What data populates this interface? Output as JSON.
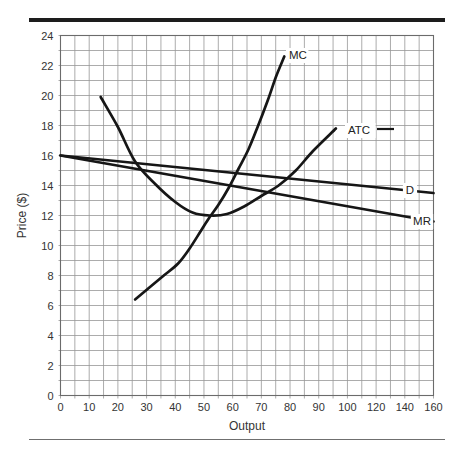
{
  "page": {
    "background": "#ffffff",
    "top_rule_color": "#1d1d1d",
    "bottom_rule_color": "#6f6f6f"
  },
  "chart_data": {
    "type": "line",
    "title": "",
    "xlabel": "Output",
    "ylabel": "Price ($)",
    "x_tick_labels": [
      "0",
      "10",
      "20",
      "30",
      "40",
      "50",
      "60",
      "70",
      "80",
      "90",
      "100",
      "120",
      "140",
      "160"
    ],
    "y_tick_labels": [
      "0",
      "2",
      "4",
      "6",
      "8",
      "10",
      "12",
      "14",
      "16",
      "18",
      "20",
      "22",
      "24"
    ],
    "ylim": [
      0,
      24
    ],
    "x_axis_note": "14 equally spaced tick labels; minor gridline at every half interval (5 units up to 100, 10 units beyond 100)",
    "grid": "on",
    "legend": "inline curve labels",
    "series": [
      {
        "name": "MC",
        "points": [
          [
            26,
            6.4
          ],
          [
            31,
            7.2
          ],
          [
            36,
            8.0
          ],
          [
            41,
            8.8
          ],
          [
            45,
            9.8
          ],
          [
            49,
            11.0
          ],
          [
            52,
            11.9
          ],
          [
            55,
            12.7
          ],
          [
            58.5,
            13.8
          ],
          [
            62,
            15.1
          ],
          [
            65.5,
            16.4
          ],
          [
            68.5,
            17.8
          ],
          [
            72.3,
            19.7
          ],
          [
            75,
            21.2
          ],
          [
            78,
            22.6
          ]
        ]
      },
      {
        "name": "ATC",
        "points": [
          [
            14,
            19.9
          ],
          [
            20,
            17.9
          ],
          [
            26,
            15.6
          ],
          [
            33,
            14.1
          ],
          [
            40,
            12.9
          ],
          [
            46,
            12.2
          ],
          [
            52,
            12.0
          ],
          [
            58,
            12.1
          ],
          [
            64,
            12.6
          ],
          [
            70,
            13.3
          ],
          [
            76,
            14.0
          ],
          [
            82,
            15.0
          ],
          [
            88,
            16.3
          ],
          [
            96,
            17.8
          ]
        ]
      },
      {
        "name": "D",
        "points": [
          [
            0,
            16
          ],
          [
            160,
            13.5
          ]
        ]
      },
      {
        "name": "MR",
        "points": [
          [
            0,
            16
          ],
          [
            160,
            11.6
          ]
        ]
      }
    ],
    "curve_labels": [
      {
        "series": "MC",
        "text": "MC",
        "px": 289,
        "py": 59,
        "anchor": "start",
        "bg": true
      },
      {
        "series": "ATC",
        "text": "ATC",
        "px": 348,
        "py": 134,
        "anchor": "start",
        "bg": true,
        "dash_from": 377,
        "dash_to": 394,
        "dash_y": 129
      },
      {
        "series": "D",
        "text": "D",
        "px": 410,
        "py": 194,
        "anchor": "middle",
        "bg": true
      },
      {
        "series": "MR",
        "text": "MR",
        "px": 422,
        "py": 225,
        "anchor": "middle",
        "bg": true
      }
    ],
    "colors": {
      "curve": "#161616",
      "grid": "#979797",
      "border": "#6b6b6b",
      "text": "#343434"
    }
  }
}
